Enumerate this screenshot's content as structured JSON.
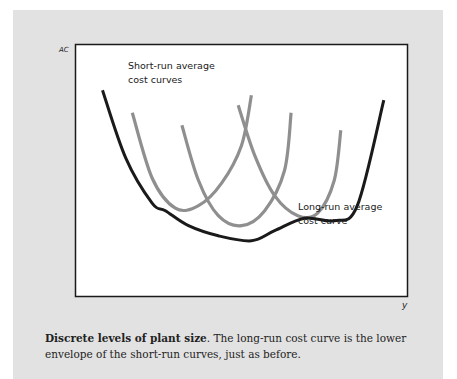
{
  "chart_data": {
    "type": "line",
    "title": "",
    "xlabel": "y",
    "ylabel": "AC",
    "grid": false,
    "xticks": [],
    "yticks": [],
    "annotations": [
      {
        "id": "sr",
        "lines": [
          "Short-run average",
          "cost curves"
        ],
        "placement": "top-left"
      },
      {
        "id": "lr",
        "lines": [
          "Long-run average",
          "cost curve"
        ],
        "placement": "lower-right"
      }
    ],
    "series": [
      {
        "name": "Long-run average cost curve",
        "color": "#1a1a1a",
        "style": "lower envelope of short-run curves",
        "points": [
          [
            0.08,
            0.82
          ],
          [
            0.15,
            0.55
          ],
          [
            0.23,
            0.37
          ],
          [
            0.27,
            0.34
          ],
          [
            0.34,
            0.28
          ],
          [
            0.43,
            0.24
          ],
          [
            0.53,
            0.22
          ],
          [
            0.6,
            0.26
          ],
          [
            0.69,
            0.31
          ],
          [
            0.78,
            0.3
          ],
          [
            0.85,
            0.36
          ],
          [
            0.93,
            0.78
          ]
        ]
      },
      {
        "name": "Short-run average cost curve 1",
        "color": "#8f8f8f",
        "points": [
          [
            0.17,
            0.73
          ],
          [
            0.23,
            0.47
          ],
          [
            0.3,
            0.35
          ],
          [
            0.37,
            0.36
          ],
          [
            0.44,
            0.45
          ],
          [
            0.5,
            0.6
          ],
          [
            0.53,
            0.8
          ]
        ]
      },
      {
        "name": "Short-run average cost curve 2",
        "color": "#8f8f8f",
        "points": [
          [
            0.32,
            0.68
          ],
          [
            0.37,
            0.46
          ],
          [
            0.43,
            0.32
          ],
          [
            0.5,
            0.28
          ],
          [
            0.57,
            0.34
          ],
          [
            0.63,
            0.5
          ],
          [
            0.65,
            0.73
          ]
        ]
      },
      {
        "name": "Short-run average cost curve 3",
        "color": "#8f8f8f",
        "points": [
          [
            0.49,
            0.76
          ],
          [
            0.54,
            0.56
          ],
          [
            0.6,
            0.4
          ],
          [
            0.67,
            0.32
          ],
          [
            0.73,
            0.33
          ],
          [
            0.78,
            0.46
          ],
          [
            0.8,
            0.66
          ]
        ]
      }
    ]
  },
  "caption": {
    "bold": "Discrete levels of plant size",
    "text": ". The long-run cost curve is the lower envelope of the short-run curves, just as before."
  }
}
